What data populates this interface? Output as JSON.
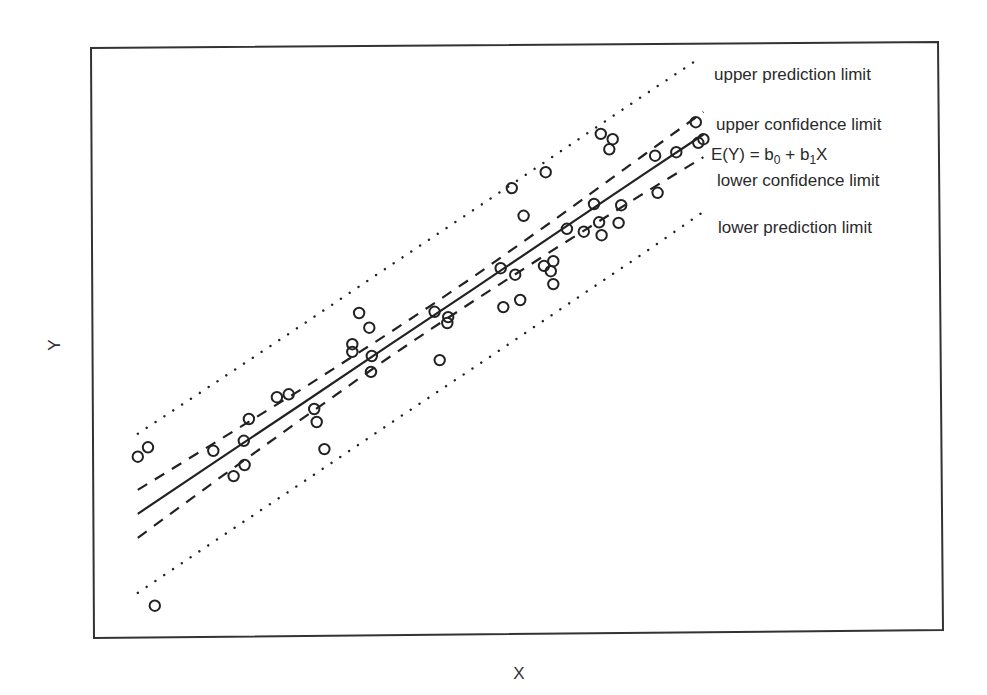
{
  "chart_data": {
    "type": "scatter",
    "title": "",
    "xlabel": "X",
    "ylabel": "Y",
    "xlim": [
      0,
      100
    ],
    "ylim": [
      0,
      100
    ],
    "grid": false,
    "axis_ticks": false,
    "legend": "inline labels at right end of lines",
    "points": [
      [
        5.4,
        30.1
      ],
      [
        6.6,
        31.7
      ],
      [
        7.4,
        4.8
      ],
      [
        14.3,
        31.1
      ],
      [
        16.7,
        26.8
      ],
      [
        18.0,
        28.7
      ],
      [
        17.9,
        32.8
      ],
      [
        18.5,
        36.5
      ],
      [
        21.8,
        40.2
      ],
      [
        23.2,
        40.7
      ],
      [
        26.2,
        38.2
      ],
      [
        26.5,
        36.0
      ],
      [
        27.4,
        31.4
      ],
      [
        30.7,
        49.2
      ],
      [
        30.7,
        47.9
      ],
      [
        31.5,
        54.5
      ],
      [
        32.7,
        52.0
      ],
      [
        33.0,
        47.2
      ],
      [
        32.9,
        44.5
      ],
      [
        40.4,
        54.7
      ],
      [
        42.0,
        53.8
      ],
      [
        41.9,
        52.8
      ],
      [
        41.0,
        46.5
      ],
      [
        48.2,
        62.1
      ],
      [
        48.5,
        55.5
      ],
      [
        49.9,
        61.0
      ],
      [
        50.5,
        56.7
      ],
      [
        49.5,
        75.7
      ],
      [
        50.9,
        71.0
      ],
      [
        53.5,
        78.4
      ],
      [
        53.3,
        62.5
      ],
      [
        54.4,
        63.3
      ],
      [
        54.1,
        61.6
      ],
      [
        54.4,
        59.4
      ],
      [
        56.0,
        68.8
      ],
      [
        58.0,
        68.3
      ],
      [
        59.8,
        69.9
      ],
      [
        60.1,
        67.7
      ],
      [
        59.2,
        73.0
      ],
      [
        62.1,
        69.8
      ],
      [
        62.4,
        72.8
      ],
      [
        60.0,
        84.9
      ],
      [
        61.4,
        84.0
      ],
      [
        61.0,
        82.3
      ],
      [
        66.4,
        81.2
      ],
      [
        66.7,
        74.9
      ],
      [
        68.9,
        81.8
      ],
      [
        71.2,
        86.9
      ],
      [
        71.5,
        83.4
      ],
      [
        72.1,
        84.0
      ]
    ],
    "series": [
      {
        "name": "upper prediction limit",
        "style": "dotted",
        "x": [
          5.4,
          15,
          25,
          35,
          40,
          45,
          55,
          65,
          71.9
        ],
        "y": [
          34.0,
          43.1,
          52.7,
          62.4,
          67.2,
          72.0,
          81.7,
          91.4,
          98.0
        ]
      },
      {
        "name": "upper confidence limit",
        "style": "dashed",
        "x": [
          5.4,
          15,
          25,
          35,
          40,
          45,
          55,
          65,
          72.1
        ],
        "y": [
          24.46,
          32.94,
          41.82,
          51.06,
          55.8,
          60.66,
          70.82,
          81.24,
          88.64
        ]
      },
      {
        "name": "E(Y) = b0 + b1X",
        "style": "solid",
        "x": [
          5.4,
          15,
          25,
          35,
          40,
          45,
          55,
          65,
          72.1
        ],
        "y": [
          20.4,
          29.7,
          39.3,
          49.0,
          53.8,
          58.6,
          68.3,
          78.0,
          84.8
        ]
      },
      {
        "name": "lower confidence limit",
        "style": "dashed",
        "x": [
          5.4,
          15,
          25,
          35,
          40,
          45,
          55,
          65,
          72.1
        ],
        "y": [
          16.34,
          26.46,
          36.78,
          46.94,
          51.8,
          56.54,
          65.78,
          74.76,
          80.96
        ]
      },
      {
        "name": "lower prediction limit",
        "style": "dotted",
        "x": [
          5.4,
          15,
          25,
          35,
          40,
          45,
          55,
          65,
          71.9
        ],
        "y": [
          7.0,
          16.3,
          25.9,
          35.6,
          40.4,
          45.2,
          54.9,
          64.6,
          71.5
        ]
      }
    ],
    "annotations": [
      {
        "id": "upper_pred",
        "text": "upper prediction limit"
      },
      {
        "id": "upper_conf",
        "text": "upper confidence limit"
      },
      {
        "id": "fit",
        "text_main": "E(Y) = b",
        "sub0": "0",
        "plus": " + b",
        "sub1": "1",
        "tail": "X"
      },
      {
        "id": "lower_conf",
        "text": "lower confidence limit"
      },
      {
        "id": "lower_pred",
        "text": "lower prediction limit"
      }
    ]
  },
  "labels": {
    "x_axis": "X",
    "y_axis": "Y",
    "upper_prediction": "upper prediction limit",
    "upper_confidence": "upper confidence limit",
    "fit_E": "E(Y) = b",
    "fit_sub0": "0",
    "fit_plus": " + b",
    "fit_sub1": "1",
    "fit_X": "X",
    "lower_confidence": "lower confidence limit",
    "lower_prediction": "lower prediction limit"
  },
  "colors": {
    "ink": "#222222",
    "frame": "#333333",
    "background": "#ffffff"
  }
}
